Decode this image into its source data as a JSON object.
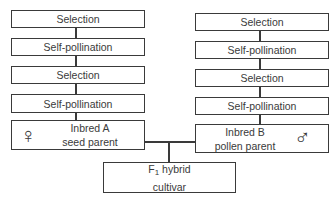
{
  "left_column": {
    "steps": [
      "Selection",
      "Self-pollination",
      "Selection",
      "Self-pollination"
    ],
    "parent": {
      "line1": "Inbred A",
      "line2": "seed parent",
      "symbol": "female-symbol",
      "glyph": "♀"
    }
  },
  "right_column": {
    "steps": [
      "Selection",
      "Self-pollination",
      "Selection",
      "Self-pollination"
    ],
    "parent": {
      "line1": "Inbred B",
      "line2": "pollen parent",
      "symbol": "male-symbol",
      "glyph": "♂"
    }
  },
  "result": {
    "prefix": "F",
    "subscript": "1",
    "line1_rest": " hybrid",
    "line2": "cultivar"
  }
}
